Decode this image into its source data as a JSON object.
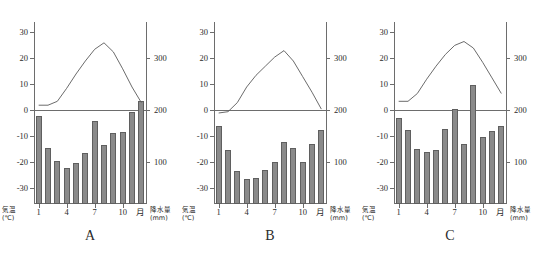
{
  "figure": {
    "axis_left_title": "気温",
    "axis_left_unit": "(℃)",
    "axis_right_title": "降水量",
    "axis_right_unit": "(mm)",
    "x_unit_label": "月",
    "bar_color": "#8a8a8a",
    "line_color": "#5a5a5a",
    "axis_color": "#6d6d6d",
    "temp_ticks": [
      "30",
      "20",
      "10",
      "0",
      "-10",
      "-20",
      "-30"
    ],
    "temp_tick_values": [
      30,
      20,
      10,
      0,
      -10,
      -20,
      -30
    ],
    "precip_ticks": [
      "300",
      "200",
      "100"
    ],
    "precip_tick_values": [
      300,
      200,
      100
    ],
    "month_ticks": [
      "1",
      "4",
      "7",
      "10"
    ],
    "month_tick_values": [
      1,
      4,
      7,
      10
    ]
  },
  "chart_data": [
    {
      "type": "bar",
      "id": "panel-a",
      "title": "A",
      "xlabel": "月",
      "ylabel": "気温 (℃)",
      "y2label": "降水量 (mm)",
      "categories": [
        1,
        2,
        3,
        4,
        5,
        6,
        7,
        8,
        9,
        10,
        11,
        12
      ],
      "ylim": [
        -36,
        34
      ],
      "y2lim": [
        20,
        370
      ],
      "grid": false,
      "legend": "none",
      "series": [
        {
          "name": "降水量",
          "type": "bar",
          "axis": "y2",
          "unit": "mm",
          "values": [
            190,
            128,
            103,
            90,
            98,
            118,
            180,
            133,
            156,
            158,
            196,
            218
          ]
        },
        {
          "name": "気温",
          "type": "line",
          "axis": "y",
          "unit": "℃",
          "values": [
            2.0,
            2.0,
            3.5,
            8.5,
            14.0,
            19.0,
            23.5,
            26.0,
            22.5,
            16.0,
            9.0,
            3.0
          ]
        }
      ]
    },
    {
      "type": "bar",
      "id": "panel-b",
      "title": "B",
      "xlabel": "月",
      "ylabel": "気温 (℃)",
      "y2label": "降水量 (mm)",
      "categories": [
        1,
        2,
        3,
        4,
        5,
        6,
        7,
        8,
        9,
        10,
        11,
        12
      ],
      "ylim": [
        -36,
        34
      ],
      "y2lim": [
        20,
        370
      ],
      "grid": false,
      "legend": "none",
      "series": [
        {
          "name": "降水量",
          "type": "bar",
          "axis": "y2",
          "unit": "mm",
          "values": [
            170,
            123,
            83,
            68,
            70,
            85,
            100,
            140,
            128,
            100,
            135,
            163
          ]
        },
        {
          "name": "気温",
          "type": "line",
          "axis": "y",
          "unit": "℃",
          "values": [
            -1.0,
            -0.5,
            3.0,
            9.0,
            13.5,
            17.0,
            20.5,
            23.0,
            19.0,
            13.0,
            7.0,
            0.5
          ]
        }
      ]
    },
    {
      "type": "bar",
      "id": "panel-c",
      "title": "C",
      "xlabel": "月",
      "ylabel": "気温 (℃)",
      "y2label": "降水量 (mm)",
      "categories": [
        1,
        2,
        3,
        4,
        5,
        6,
        7,
        8,
        9,
        10,
        11,
        12
      ],
      "ylim": [
        -36,
        34
      ],
      "y2lim": [
        20,
        370
      ],
      "grid": false,
      "legend": "none",
      "series": [
        {
          "name": "降水量",
          "type": "bar",
          "axis": "y2",
          "unit": "mm",
          "values": [
            185,
            163,
            125,
            120,
            123,
            165,
            202,
            135,
            248,
            148,
            160,
            170
          ]
        },
        {
          "name": "気温",
          "type": "line",
          "axis": "y",
          "unit": "℃",
          "values": [
            3.5,
            3.5,
            6.5,
            12.0,
            17.0,
            21.5,
            25.0,
            26.5,
            24.0,
            18.5,
            12.5,
            6.5
          ]
        }
      ]
    }
  ]
}
